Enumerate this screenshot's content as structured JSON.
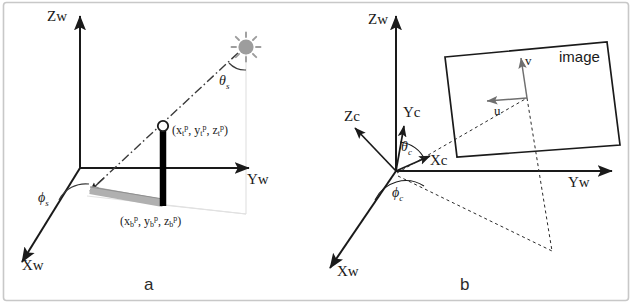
{
  "figure": {
    "background_color": "#ffffff",
    "border_color": "#c8c8c8",
    "line_color": "#1a1a1a",
    "shadow_color": "#a9a9a9",
    "sun_color": "#9a9a9a",
    "pole_color": "#000000",
    "faint_guide_color": "#d8d8d8"
  },
  "panel_a": {
    "caption": "a",
    "axes": {
      "z": "Zw",
      "y": "Yw",
      "x": "Xw"
    },
    "angles": {
      "zenith": "θ",
      "zenith_sub": "s",
      "azimuth": "ϕ",
      "azimuth_sub": "s"
    },
    "points": {
      "top": {
        "open": "(",
        "x": "x",
        "x_sub": "t",
        "x_sup": "p",
        "comma1": ", ",
        "y": "y",
        "y_sub": "t",
        "y_sup": "p",
        "comma2": ", ",
        "z": "z",
        "z_sub": "t",
        "z_sup": "p",
        "close": ")"
      },
      "bottom": {
        "open": "(",
        "x": "x",
        "x_sub": "b",
        "x_sup": "p",
        "comma1": ", ",
        "y": "y",
        "y_sub": "b",
        "y_sup": "p",
        "comma2": ", ",
        "z": "z",
        "z_sub": "b",
        "z_sup": "p",
        "close": ")"
      }
    },
    "sun_icon": "sun-icon",
    "ray_style": "dash-dot"
  },
  "panel_b": {
    "caption": "b",
    "axes": {
      "z_world": "Zw",
      "y_world": "Yw",
      "x_world": "Xw",
      "z_cam": "Zc",
      "y_cam": "Yc",
      "x_cam": "Xc"
    },
    "angles": {
      "zenith": "θ",
      "zenith_sub": "c",
      "azimuth": "ϕ",
      "azimuth_sub": "c"
    },
    "image_plane": {
      "label": "image",
      "u_axis": "u",
      "v_axis": "v"
    }
  }
}
